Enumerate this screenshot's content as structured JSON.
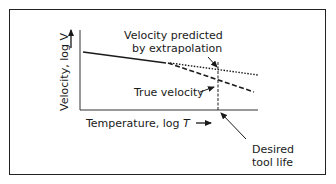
{
  "diagram": {
    "annotations": {
      "predicted_line1": "Velocity predicted",
      "predicted_line2": "by extrapolation",
      "true_velocity": "True velocity",
      "desired_line1": "Desired",
      "desired_line2": "tool life"
    },
    "axes": {
      "y_label_prefix": "Velocity, log ",
      "y_label_var": "V",
      "x_label_prefix": "Temperature, log ",
      "x_label_var": "T"
    },
    "lines": [
      {
        "name": "measured",
        "style": "solid"
      },
      {
        "name": "extrapolated",
        "style": "dotted"
      },
      {
        "name": "true",
        "style": "dashed"
      },
      {
        "name": "desired-tool-life-marker",
        "style": "dashed-vertical"
      }
    ],
    "colors": {
      "line": "#1a1a1a",
      "border": "#222222",
      "background": "#ffffff"
    }
  }
}
